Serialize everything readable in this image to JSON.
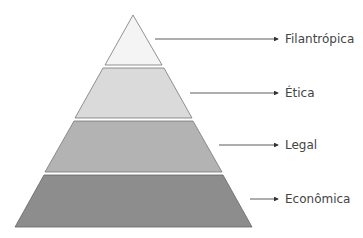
{
  "diagram": {
    "type": "pyramid",
    "levels": [
      {
        "label": "Filantrópica",
        "fill": "#f4f4f4"
      },
      {
        "label": "Ética",
        "fill": "#dadada"
      },
      {
        "label": "Legal",
        "fill": "#b3b3b3"
      },
      {
        "label": "Econômica",
        "fill": "#8d8d8d"
      }
    ]
  }
}
